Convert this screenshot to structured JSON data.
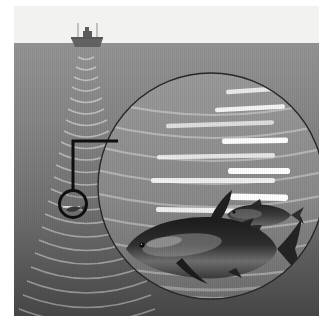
{
  "illustration": {
    "title": "Sonar fish-finding diagram",
    "description": "A fishing vessel on the water surface emits a sonar beam downward; a circular magnifier callout enlarges a region of the sonar return showing white echo traces and two fish.",
    "canvas": {
      "width": 334,
      "height": 331
    },
    "frame": {
      "x": 14,
      "y": 6,
      "width": 305,
      "height": 310
    }
  },
  "colors": {
    "page_background": "#ffffff",
    "sky": "#f2f2f0",
    "water_top": "#8e8e8e",
    "water_mid": "#7a7a7a",
    "water_bottom": "#4d4d4d",
    "boat_hull": "#6b6b6b",
    "boat_dark": "#5a5a5a",
    "sonar_arc": "#e8e8e8",
    "echo_bright": "#ffffff",
    "echo_soft": "#d9d9d9",
    "callout_stroke": "#111111",
    "lens_stroke": "#2a2a2a",
    "fish_body": "#2e2e2e",
    "fish_highlight": "#b9b9b9"
  },
  "sky": {
    "label": "sky-above-waterline",
    "waterline_y": 37,
    "fill": "#f2f2f0"
  },
  "water": {
    "label": "water-column",
    "top_y": 37,
    "bottom_y": 310,
    "gradient_stops": [
      {
        "offset": "0%",
        "color": "#949494"
      },
      {
        "offset": "30%",
        "color": "#858585"
      },
      {
        "offset": "62%",
        "color": "#6f6f6f"
      },
      {
        "offset": "100%",
        "color": "#474747"
      }
    ]
  },
  "vessel": {
    "name": "fishing-boat",
    "x": 72,
    "y": 34,
    "hull_width": 30,
    "masts": 2,
    "cabin": "wheelhouse",
    "fill": "#5f5f5f"
  },
  "sonar_beam": {
    "name": "sonar-cone",
    "origin_x": 72,
    "origin_y": 40,
    "arc_count": 22,
    "spread_deg": 26,
    "max_depth": 300,
    "arc_color": "#e6e6e6",
    "arc_opacity": 0.55
  },
  "callout": {
    "name": "magnifier-callout",
    "source_circle": {
      "cx": 59,
      "cy": 198,
      "r": 15,
      "stroke": "#0f0f0f",
      "stroke_width": 3
    },
    "connector_path": "M 59 183 L 59 135 L 104 135",
    "stroke": "#0f0f0f",
    "stroke_width": 3,
    "target": "lens"
  },
  "lens": {
    "name": "magnified-sonar-view",
    "cx": 197,
    "cy": 180,
    "r": 113,
    "stroke": "#262626",
    "stroke_width": 1.4,
    "inner_tint": "#8a8a8a"
  },
  "echo_traces": {
    "name": "sonar-echo-returns",
    "description": "Horizontal white echo bars representing returned sonar pulses from fish schools, brightest toward the right of the lens.",
    "bars": [
      {
        "x": 212,
        "y": 82,
        "w": 56,
        "h": 4.5,
        "rot": -4,
        "brightness": 0.8
      },
      {
        "x": 201,
        "y": 100,
        "w": 70,
        "h": 4.5,
        "rot": -3,
        "brightness": 0.9
      },
      {
        "x": 152,
        "y": 116,
        "w": 108,
        "h": 4.5,
        "rot": -2,
        "brightness": 0.7
      },
      {
        "x": 208,
        "y": 132,
        "w": 66,
        "h": 5.5,
        "rot": -1,
        "brightness": 1.0
      },
      {
        "x": 143,
        "y": 148,
        "w": 118,
        "h": 4.5,
        "rot": -1,
        "brightness": 0.78
      },
      {
        "x": 214,
        "y": 162,
        "w": 62,
        "h": 6,
        "rot": 0,
        "brightness": 1.0
      },
      {
        "x": 137,
        "y": 172,
        "w": 124,
        "h": 5,
        "rot": 0,
        "brightness": 0.85
      },
      {
        "x": 216,
        "y": 188,
        "w": 58,
        "h": 6.5,
        "rot": 1,
        "brightness": 1.0
      },
      {
        "x": 142,
        "y": 202,
        "w": 114,
        "h": 5,
        "rot": 1,
        "brightness": 0.88
      },
      {
        "x": 222,
        "y": 203,
        "w": 46,
        "h": 6,
        "rot": 1,
        "brightness": 1.0
      },
      {
        "x": 146,
        "y": 228,
        "w": 66,
        "h": 5.5,
        "rot": 1,
        "brightness": 1.0
      }
    ]
  },
  "fish": [
    {
      "name": "large-tuna",
      "species_look": "bluefin-tuna",
      "cx": 183,
      "cy": 240,
      "length": 150,
      "facing": "right",
      "fill": "#262626"
    },
    {
      "name": "small-fish",
      "species_look": "small-pelagic",
      "cx": 244,
      "cy": 209,
      "length": 70,
      "facing": "right",
      "fill": "#333333"
    },
    {
      "name": "tiny-fish-in-source-circle",
      "cx": 59,
      "cy": 200,
      "length": 14,
      "facing": "right",
      "fill": "#3a3a3a"
    }
  ],
  "seabed_arcs": {
    "name": "deep-return-arcs",
    "count": 3,
    "color": "#cccccc"
  }
}
